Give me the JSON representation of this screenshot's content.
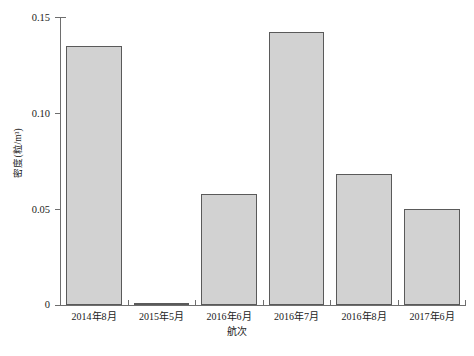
{
  "chart_data": {
    "type": "bar",
    "title": "",
    "xlabel": "航次",
    "ylabel": "密度(粒/m³)",
    "categories": [
      "2014年8月",
      "2015年5月",
      "2016年6月",
      "2016年7月",
      "2016年8月",
      "2017年6月"
    ],
    "values": [
      0.135,
      0.0,
      0.058,
      0.142,
      0.068,
      0.05
    ],
    "ylim": [
      0,
      0.15
    ],
    "yticks": [
      0,
      0.05,
      0.1,
      0.15
    ],
    "ytick_labels": [
      "0",
      "0.05",
      "0.10",
      "0.15"
    ],
    "grid": false,
    "legend": null,
    "bar_fill_color": "#d2d2d2",
    "bar_edge_color": "#5a5a5a",
    "axis_color": "#6e6e6e"
  },
  "axes": {
    "y_title": "密度(粒/m³)",
    "x_title": "航次",
    "ticks": [
      {
        "label": "0.15",
        "value": 0.15
      },
      {
        "label": "0.10",
        "value": 0.1
      },
      {
        "label": "0.05",
        "value": 0.05
      },
      {
        "label": "0",
        "value": 0
      }
    ]
  },
  "caption": ""
}
